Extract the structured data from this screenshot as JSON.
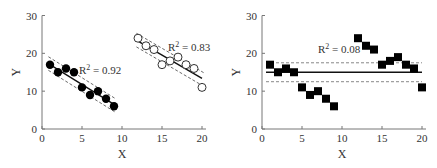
{
  "chart_data": [
    {
      "type": "scatter",
      "xlabel": "X",
      "ylabel": "Y",
      "xlim": [
        0,
        20
      ],
      "ylim": [
        0,
        30
      ],
      "xticks": [
        0,
        5,
        10,
        15,
        20
      ],
      "yticks": [
        0,
        10,
        20,
        30
      ],
      "grid": false,
      "series": [
        {
          "name": "group-1",
          "marker": "filled-circle",
          "x": [
            1,
            2,
            3,
            4,
            5,
            6,
            7,
            8,
            9
          ],
          "y": [
            17,
            15,
            16,
            15,
            11,
            9,
            10,
            8,
            6
          ],
          "fit": {
            "x0": 1,
            "y0": 17,
            "x1": 9,
            "y1": 6.5
          },
          "r2_label": "R² = 0.92"
        },
        {
          "name": "group-2",
          "marker": "open-circle",
          "x": [
            12,
            13,
            14,
            15,
            16,
            17,
            18,
            19,
            20
          ],
          "y": [
            24,
            22,
            21,
            17,
            18,
            19,
            17,
            16,
            11
          ],
          "fit": {
            "x0": 12,
            "y0": 23.2,
            "x1": 20,
            "y1": 13.4
          },
          "r2_label": "R² = 0.83"
        }
      ]
    },
    {
      "type": "scatter",
      "xlabel": "X",
      "ylabel": "Y",
      "xlim": [
        0,
        20
      ],
      "ylim": [
        0,
        30
      ],
      "xticks": [
        0,
        5,
        10,
        15,
        20
      ],
      "yticks": [
        0,
        10,
        20,
        30
      ],
      "grid": false,
      "series": [
        {
          "name": "combined",
          "marker": "filled-square",
          "x": [
            1,
            2,
            3,
            4,
            5,
            6,
            7,
            8,
            9,
            12,
            13,
            14,
            15,
            16,
            17,
            18,
            19,
            20
          ],
          "y": [
            17,
            15,
            16,
            15,
            11,
            9,
            10,
            8,
            6,
            24,
            22,
            21,
            17,
            18,
            19,
            17,
            16,
            11
          ],
          "fit": {
            "x0": 1,
            "y0": 15,
            "x1": 20,
            "y1": 15
          },
          "ci": [
            12.5,
            17.5
          ],
          "r2_label": "R² = 0.08"
        }
      ]
    }
  ],
  "labels": {
    "x": "X",
    "y": "Y",
    "r2_a": "R",
    "r2_a_val": " = 0.92",
    "r2_b": "R",
    "r2_b_val": " = 0.83",
    "r2_c": "R",
    "r2_c_val": " = 0.08",
    "sup": "2",
    "t0": "0",
    "t5": "5",
    "t10": "10",
    "t15": "15",
    "t20": "20",
    "t30": "30"
  }
}
